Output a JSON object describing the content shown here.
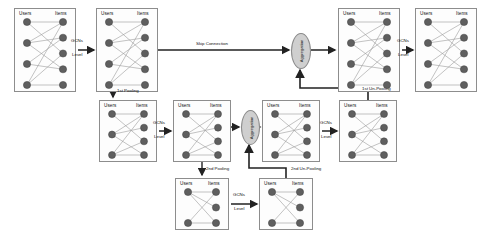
{
  "figure": {
    "node_fill": "#5f5f5f",
    "node_stroke": "#3f3f3f",
    "edge_color": "#9a9a9a",
    "box_stroke": "#8d8d8d",
    "arrow_color": "#222222",
    "agg_fill": "#cfcfcf"
  },
  "column_headers": {
    "users": "Users",
    "items": "Items"
  },
  "labels": {
    "gcns": "GCNs",
    "level": "Level",
    "skip_connection": "Skip Connection",
    "pooling_1": "1st Pooling",
    "pooling_2": "2nd Pooling",
    "unpooling_1": "1st Un-Pooling",
    "unpooling_2": "2nd Un-Pooling",
    "aggregation": "Aggregation"
  },
  "graphs": [
    {
      "id": "g1",
      "row": "top",
      "x": 14,
      "y": 8,
      "w": 62,
      "h": 84,
      "users": 4,
      "items": 5,
      "edges": [
        [
          0,
          0
        ],
        [
          0,
          2
        ],
        [
          1,
          0
        ],
        [
          1,
          1
        ],
        [
          1,
          3
        ],
        [
          2,
          1
        ],
        [
          2,
          3
        ],
        [
          3,
          0
        ],
        [
          3,
          2
        ],
        [
          3,
          4
        ]
      ]
    },
    {
      "id": "g2",
      "row": "top",
      "x": 96,
      "y": 8,
      "w": 62,
      "h": 84,
      "users": 4,
      "items": 5,
      "edges": [
        [
          0,
          0
        ],
        [
          0,
          2
        ],
        [
          1,
          0
        ],
        [
          1,
          1
        ],
        [
          1,
          3
        ],
        [
          2,
          1
        ],
        [
          2,
          3
        ],
        [
          3,
          0
        ],
        [
          3,
          2
        ],
        [
          3,
          4
        ]
      ]
    },
    {
      "id": "g3",
      "row": "top",
      "x": 338,
      "y": 8,
      "w": 62,
      "h": 84,
      "users": 4,
      "items": 5,
      "edges": [
        [
          0,
          0
        ],
        [
          0,
          2
        ],
        [
          1,
          0
        ],
        [
          1,
          1
        ],
        [
          1,
          3
        ],
        [
          2,
          1
        ],
        [
          2,
          3
        ],
        [
          3,
          0
        ],
        [
          3,
          2
        ],
        [
          3,
          4
        ]
      ]
    },
    {
      "id": "g4",
      "row": "top",
      "x": 415,
      "y": 8,
      "w": 62,
      "h": 84,
      "users": 4,
      "items": 5,
      "edges": [
        [
          0,
          0
        ],
        [
          0,
          2
        ],
        [
          1,
          0
        ],
        [
          1,
          1
        ],
        [
          1,
          3
        ],
        [
          2,
          1
        ],
        [
          2,
          3
        ],
        [
          3,
          0
        ],
        [
          3,
          2
        ],
        [
          3,
          4
        ]
      ]
    },
    {
      "id": "g5",
      "row": "mid",
      "x": 99,
      "y": 100,
      "w": 58,
      "h": 62,
      "users": 3,
      "items": 4,
      "edges": [
        [
          0,
          0
        ],
        [
          0,
          2
        ],
        [
          1,
          0
        ],
        [
          1,
          1
        ],
        [
          1,
          3
        ],
        [
          2,
          0
        ],
        [
          2,
          2
        ],
        [
          2,
          3
        ]
      ]
    },
    {
      "id": "g6",
      "row": "mid",
      "x": 173,
      "y": 100,
      "w": 58,
      "h": 62,
      "users": 3,
      "items": 4,
      "edges": [
        [
          0,
          0
        ],
        [
          0,
          2
        ],
        [
          1,
          0
        ],
        [
          1,
          1
        ],
        [
          1,
          3
        ],
        [
          2,
          0
        ],
        [
          2,
          2
        ],
        [
          2,
          3
        ]
      ]
    },
    {
      "id": "g7",
      "row": "mid",
      "x": 262,
      "y": 100,
      "w": 58,
      "h": 62,
      "users": 3,
      "items": 4,
      "edges": [
        [
          0,
          0
        ],
        [
          0,
          2
        ],
        [
          1,
          0
        ],
        [
          1,
          1
        ],
        [
          1,
          3
        ],
        [
          2,
          0
        ],
        [
          2,
          2
        ],
        [
          2,
          3
        ]
      ]
    },
    {
      "id": "g8",
      "row": "mid",
      "x": 339,
      "y": 100,
      "w": 58,
      "h": 62,
      "users": 3,
      "items": 4,
      "edges": [
        [
          0,
          0
        ],
        [
          0,
          2
        ],
        [
          1,
          0
        ],
        [
          1,
          1
        ],
        [
          1,
          3
        ],
        [
          2,
          0
        ],
        [
          2,
          2
        ],
        [
          2,
          3
        ]
      ]
    },
    {
      "id": "g9",
      "row": "bottom",
      "x": 175,
      "y": 178,
      "w": 54,
      "h": 52,
      "users": 2,
      "items": 3,
      "edges": [
        [
          0,
          0
        ],
        [
          0,
          1
        ],
        [
          0,
          2
        ],
        [
          1,
          0
        ],
        [
          1,
          2
        ]
      ]
    },
    {
      "id": "g10",
      "row": "bottom",
      "x": 259,
      "y": 178,
      "w": 54,
      "h": 52,
      "users": 2,
      "items": 3,
      "edges": [
        [
          0,
          0
        ],
        [
          0,
          1
        ],
        [
          0,
          2
        ],
        [
          1,
          0
        ],
        [
          1,
          2
        ]
      ]
    }
  ],
  "aggregators": [
    {
      "id": "agg1",
      "x": 291,
      "y": 33,
      "w": 18,
      "h": 34
    },
    {
      "id": "agg2",
      "x": 241,
      "y": 110,
      "w": 17,
      "h": 33
    }
  ],
  "gcn_arrows": [
    {
      "id": "gcn-top-1",
      "x1": 78,
      "x2": 94,
      "y": 50,
      "lx": 71,
      "ly": 38
    },
    {
      "id": "gcn-top-2",
      "x1": 402,
      "x2": 413,
      "y": 50,
      "lx": 397,
      "ly": 38
    },
    {
      "id": "gcn-mid-1",
      "x1": 159,
      "x2": 171,
      "y": 131,
      "lx": 153,
      "ly": 120
    },
    {
      "id": "gcn-mid-2",
      "x1": 322,
      "x2": 337,
      "y": 131,
      "lx": 320,
      "ly": 120
    },
    {
      "id": "gcn-bottom-1",
      "x1": 231,
      "x2": 257,
      "y": 204,
      "lx": 233,
      "ly": 192
    }
  ]
}
